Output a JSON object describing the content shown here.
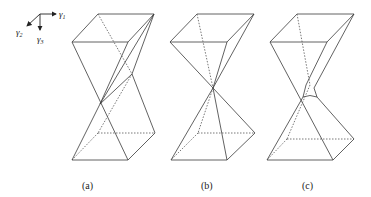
{
  "figure": {
    "axes": {
      "x_label": "γ",
      "x_sub": "1",
      "y_label": "γ",
      "y_sub": "2",
      "z_label": "γ",
      "z_sub": "3"
    },
    "panels": [
      {
        "id": "a",
        "caption": "(a)",
        "description": "Twisted double pyramid; apices offset, crossing above neck"
      },
      {
        "id": "b",
        "caption": "(b)",
        "description": "Double pyramid meeting at a single common apex"
      },
      {
        "id": "c",
        "caption": "(c)",
        "description": "Double pyramid with truncated neck joined by a small curved segment"
      }
    ]
  }
}
